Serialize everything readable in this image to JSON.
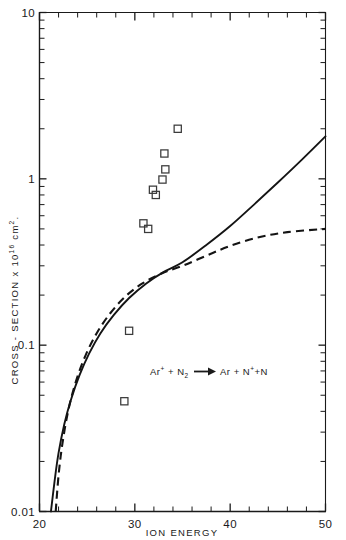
{
  "chart_data": {
    "type": "scatter",
    "title": "",
    "subtitle": "",
    "xlabel": "ION ENERGY",
    "ylabel": "CROSS - SECTION x 10¹⁶ cm².",
    "ylabel_parts": {
      "main": "CROSS - SECTION x 10",
      "exponent": "16",
      "units": "cm",
      "units_exponent": "2",
      "trailing": "."
    },
    "annotation": "Ar⁺ + N₂ → Ar + N⁺ + N",
    "annotation_parts": {
      "reactant_1": "Ar",
      "reactant_1_sup": "+",
      "plus_1": "+",
      "reactant_2": "N",
      "reactant_2_sub": "2",
      "arrow": "⟶",
      "product_1": "Ar",
      "plus_2": "+",
      "product_2": "N",
      "product_2_sup": "+",
      "plus_3": "+",
      "product_3": "N"
    },
    "xscale": "linear",
    "yscale": "log",
    "xlim": [
      20,
      50
    ],
    "ylim": [
      0.01,
      10
    ],
    "grid": false,
    "legend": "none",
    "x_ticks": [
      20,
      30,
      40,
      50
    ],
    "x_tick_labels": [
      "20",
      "30",
      "40",
      "50"
    ],
    "x_minor_ticks": [
      22,
      24,
      26,
      28,
      32,
      34,
      36,
      38,
      42,
      44,
      46,
      48
    ],
    "y_ticks": [
      0.01,
      0.1,
      1,
      10
    ],
    "y_tick_labels": [
      "0.01",
      "0.1",
      "1",
      "10"
    ],
    "series": [
      {
        "name": "experimental data",
        "type": "scatter",
        "marker": "open-square",
        "points": [
          {
            "x": 28.9,
            "y": 0.046
          },
          {
            "x": 29.4,
            "y": 0.122
          },
          {
            "x": 30.9,
            "y": 0.54
          },
          {
            "x": 31.4,
            "y": 0.5
          },
          {
            "x": 31.9,
            "y": 0.86
          },
          {
            "x": 32.2,
            "y": 0.8
          },
          {
            "x": 32.9,
            "y": 0.99
          },
          {
            "x": 33.2,
            "y": 1.14
          },
          {
            "x": 33.1,
            "y": 1.42
          },
          {
            "x": 34.5,
            "y": 2.0
          }
        ]
      },
      {
        "name": "theory curve solid",
        "type": "line",
        "style": "solid",
        "points": [
          {
            "x": 21.2,
            "y": 0.01
          },
          {
            "x": 21.6,
            "y": 0.0155
          },
          {
            "x": 22.0,
            "y": 0.0225
          },
          {
            "x": 22.6,
            "y": 0.0335
          },
          {
            "x": 23.3,
            "y": 0.047
          },
          {
            "x": 24.2,
            "y": 0.066
          },
          {
            "x": 25.2,
            "y": 0.089
          },
          {
            "x": 26.4,
            "y": 0.118
          },
          {
            "x": 27.8,
            "y": 0.152
          },
          {
            "x": 29.4,
            "y": 0.192
          },
          {
            "x": 31.2,
            "y": 0.235
          },
          {
            "x": 33.0,
            "y": 0.275
          },
          {
            "x": 35.0,
            "y": 0.315
          },
          {
            "x": 37.5,
            "y": 0.4
          },
          {
            "x": 40.0,
            "y": 0.52
          },
          {
            "x": 42.5,
            "y": 0.7
          },
          {
            "x": 45.0,
            "y": 0.95
          },
          {
            "x": 47.5,
            "y": 1.3
          },
          {
            "x": 50.0,
            "y": 1.8
          }
        ]
      },
      {
        "name": "theory curve dashed",
        "type": "line",
        "style": "dashed",
        "points": [
          {
            "x": 21.7,
            "y": 0.01
          },
          {
            "x": 22.0,
            "y": 0.0165
          },
          {
            "x": 22.4,
            "y": 0.0255
          },
          {
            "x": 23.0,
            "y": 0.04
          },
          {
            "x": 23.8,
            "y": 0.06
          },
          {
            "x": 24.8,
            "y": 0.086
          },
          {
            "x": 26.0,
            "y": 0.118
          },
          {
            "x": 27.4,
            "y": 0.155
          },
          {
            "x": 29.0,
            "y": 0.196
          },
          {
            "x": 30.8,
            "y": 0.235
          },
          {
            "x": 32.8,
            "y": 0.27
          },
          {
            "x": 35.0,
            "y": 0.3
          },
          {
            "x": 37.5,
            "y": 0.345
          },
          {
            "x": 40.0,
            "y": 0.395
          },
          {
            "x": 43.0,
            "y": 0.445
          },
          {
            "x": 46.0,
            "y": 0.478
          },
          {
            "x": 50.0,
            "y": 0.5
          }
        ]
      }
    ]
  }
}
